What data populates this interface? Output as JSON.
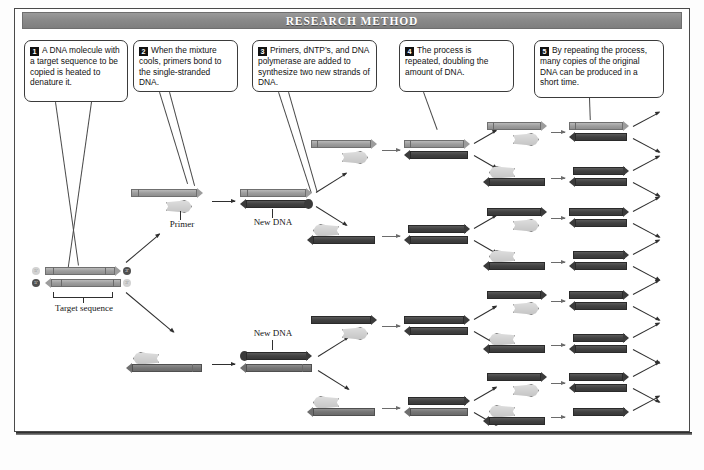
{
  "figure": {
    "header_title": "RESEARCH METHOD",
    "topic": "polymerase-chain-reaction"
  },
  "callouts": [
    {
      "number": "1",
      "text": "A DNA molecule with a target sequence to be copied is heated to denature it."
    },
    {
      "number": "2",
      "text": "When the mixture cools, primers bond to the single-stranded DNA."
    },
    {
      "number": "3",
      "text": "Primers, dNTP’s, and DNA polymerase are added to synthesize two new strands of DNA."
    },
    {
      "number": "4",
      "text": "The process is repeated, doubling the amount of DNA."
    },
    {
      "number": "5",
      "text": "By repeating the process, many copies of the original DNA can be produced in a short time."
    }
  ],
  "labels": {
    "target_sequence": "Target sequence",
    "primer": "Primer",
    "new_dna_upper": "New DNA",
    "new_dna_lower": "New DNA"
  },
  "end_marks": {
    "five_prime": "5′",
    "three_prime": "3′"
  },
  "colors": {
    "header_bar": "#8a8a8a",
    "header_text": "#ffffff",
    "frame_border": "#4a4a4a",
    "strand_light": "#9d9d9d",
    "strand_mid": "#757575",
    "strand_dark": "#414141",
    "primer_fill": "#cfcfcf",
    "arrow": "#2f2f2f",
    "badge": "#111111"
  },
  "counts": {
    "cycle1_products": 2,
    "cycle2_products": 4,
    "cycle3_products": 8,
    "arrows_per_product": 2
  }
}
